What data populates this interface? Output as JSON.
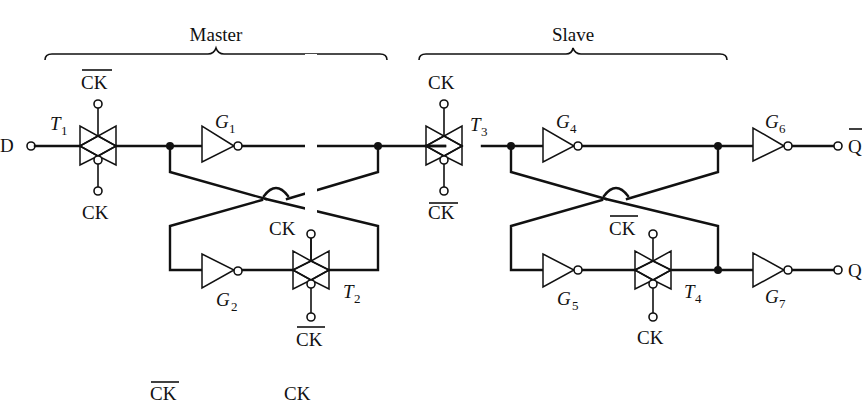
{
  "diagram": {
    "title_master": "Master",
    "title_slave": "Slave",
    "input": "D",
    "outputs": {
      "q_bar": "Q",
      "q": "Q"
    },
    "transmission_gates": [
      {
        "name": "T",
        "sub": "1",
        "top": "CK",
        "top_bar": true,
        "bottom": "CK",
        "bottom_bar": false
      },
      {
        "name": "T",
        "sub": "2",
        "top": "CK",
        "top_bar": false,
        "bottom": "CK",
        "bottom_bar": true
      },
      {
        "name": "T",
        "sub": "3",
        "top": "CK",
        "top_bar": false,
        "bottom": "CK",
        "bottom_bar": true
      },
      {
        "name": "T",
        "sub": "4",
        "top": "CK",
        "top_bar": true,
        "bottom": "CK",
        "bottom_bar": false
      }
    ],
    "inverters": [
      {
        "name": "G",
        "sub": "1"
      },
      {
        "name": "G",
        "sub": "2"
      },
      {
        "name": "G",
        "sub": "4"
      },
      {
        "name": "G",
        "sub": "5"
      },
      {
        "name": "G",
        "sub": "6"
      },
      {
        "name": "G",
        "sub": "7"
      }
    ],
    "legend": {
      "ck_bar": "CK",
      "ck": "CK"
    }
  }
}
